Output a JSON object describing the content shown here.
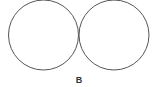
{
  "diagram": {
    "circles": [
      {
        "name": "left-circle",
        "cx": 43.5,
        "cy": 35,
        "r": 35
      },
      {
        "name": "right-circle",
        "cx": 114,
        "cy": 35,
        "r": 35
      }
    ],
    "stroke_color": "#555555",
    "label": "B"
  }
}
